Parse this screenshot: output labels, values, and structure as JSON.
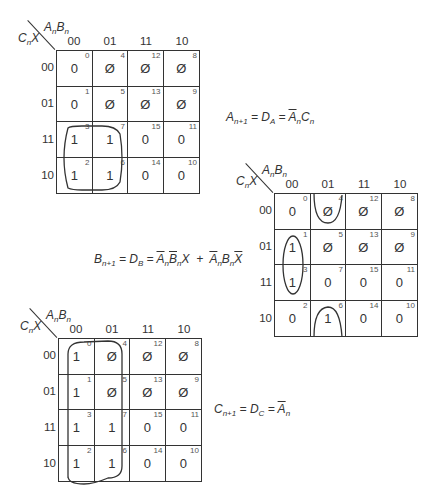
{
  "col_labels": [
    "00",
    "01",
    "11",
    "10"
  ],
  "row_labels": [
    "00",
    "01",
    "11",
    "10"
  ],
  "corner": {
    "top_var": "AnBn",
    "left_var": "CnX"
  },
  "maps": [
    {
      "id": "map-A",
      "cells": [
        [
          {
            "v": "0",
            "i": "0"
          },
          {
            "v": "Ø",
            "i": "4"
          },
          {
            "v": "Ø",
            "i": "12"
          },
          {
            "v": "Ø",
            "i": "8"
          }
        ],
        [
          {
            "v": "0",
            "i": "1"
          },
          {
            "v": "Ø",
            "i": "5"
          },
          {
            "v": "Ø",
            "i": "13"
          },
          {
            "v": "Ø",
            "i": "9"
          }
        ],
        [
          {
            "v": "1",
            "i": "3"
          },
          {
            "v": "1",
            "i": "7"
          },
          {
            "v": "0",
            "i": "15"
          },
          {
            "v": "0",
            "i": "11"
          }
        ],
        [
          {
            "v": "1",
            "i": "2"
          },
          {
            "v": "1",
            "i": "6"
          },
          {
            "v": "0",
            "i": "14"
          },
          {
            "v": "0",
            "i": "10"
          }
        ]
      ],
      "equation": {
        "lhs": "A",
        "lhs_sub": "n+1",
        "d": "D",
        "d_sub": "A",
        "rhs": "Ā_n C_n"
      }
    },
    {
      "id": "map-B",
      "cells": [
        [
          {
            "v": "0",
            "i": "0"
          },
          {
            "v": "Ø",
            "i": "4"
          },
          {
            "v": "Ø",
            "i": "12"
          },
          {
            "v": "Ø",
            "i": "8"
          }
        ],
        [
          {
            "v": "1",
            "i": "1"
          },
          {
            "v": "Ø",
            "i": "5"
          },
          {
            "v": "Ø",
            "i": "13"
          },
          {
            "v": "Ø",
            "i": "9"
          }
        ],
        [
          {
            "v": "1",
            "i": "3"
          },
          {
            "v": "0",
            "i": "7"
          },
          {
            "v": "0",
            "i": "15"
          },
          {
            "v": "0",
            "i": "11"
          }
        ],
        [
          {
            "v": "0",
            "i": "2"
          },
          {
            "v": "1",
            "i": "6"
          },
          {
            "v": "0",
            "i": "14"
          },
          {
            "v": "0",
            "i": "10"
          }
        ]
      ],
      "equation": {
        "lhs": "B",
        "lhs_sub": "n+1",
        "d": "D",
        "d_sub": "B",
        "rhs": "Ā_n B̄_n X + Ā_n B_n X̄"
      }
    },
    {
      "id": "map-C",
      "cells": [
        [
          {
            "v": "1",
            "i": "0"
          },
          {
            "v": "Ø",
            "i": "4"
          },
          {
            "v": "Ø",
            "i": "12"
          },
          {
            "v": "Ø",
            "i": "8"
          }
        ],
        [
          {
            "v": "1",
            "i": "1"
          },
          {
            "v": "Ø",
            "i": "5"
          },
          {
            "v": "Ø",
            "i": "13"
          },
          {
            "v": "Ø",
            "i": "9"
          }
        ],
        [
          {
            "v": "1",
            "i": "3"
          },
          {
            "v": "1",
            "i": "7"
          },
          {
            "v": "0",
            "i": "15"
          },
          {
            "v": "0",
            "i": "11"
          }
        ],
        [
          {
            "v": "1",
            "i": "2"
          },
          {
            "v": "1",
            "i": "6"
          },
          {
            "v": "0",
            "i": "14"
          },
          {
            "v": "0",
            "i": "10"
          }
        ]
      ],
      "equation": {
        "lhs": "C",
        "lhs_sub": "n+1",
        "d": "D",
        "d_sub": "C",
        "rhs": "Ā_n"
      }
    }
  ],
  "eq_text": {
    "a_lhs": "A",
    "a_lhs_sub": "n+1",
    "a_mid": " = D",
    "a_mid_sub": "A",
    "a_eq": " = ",
    "a_t1": "A",
    "a_t1_sub": "n",
    "a_t2": "C",
    "a_t2_sub": "n",
    "b_lhs": "B",
    "b_lhs_sub": "n+1",
    "b_mid": " = D",
    "b_mid_sub": "B",
    "b_eq": " = ",
    "b_t1": "A",
    "b_t1_sub": "n",
    "b_t2": "B",
    "b_t2_sub": "n",
    "b_t3": "X",
    "b_plus": "  +  ",
    "b_t4": "A",
    "b_t4_sub": "n",
    "b_t5": "B",
    "b_t5_sub": "n",
    "b_t6": "X",
    "c_lhs": "C",
    "c_lhs_sub": "n+1",
    "c_mid": " = D",
    "c_mid_sub": "C",
    "c_eq": " = ",
    "c_t1": "A",
    "c_t1_sub": "n"
  },
  "var_labels": {
    "A": "A",
    "B": "B",
    "C": "C",
    "X": "X",
    "n": "n"
  }
}
